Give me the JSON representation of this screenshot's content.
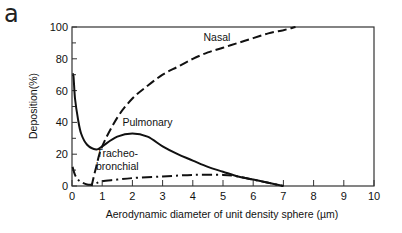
{
  "panel_label": "a",
  "chart_data": {
    "type": "line",
    "title": "",
    "xlabel": "Aerodynamic diameter of unit density sphere (µm)",
    "ylabel": "Deposition(%)",
    "xlim": [
      0,
      10
    ],
    "ylim": [
      0,
      100
    ],
    "x_ticks": [
      "0",
      "1",
      "2",
      "3",
      "4",
      "5",
      "6",
      "7",
      "8",
      "9",
      "10"
    ],
    "y_ticks": [
      "0",
      "20",
      "40",
      "60",
      "80",
      "100"
    ],
    "grid": false,
    "legend": "inline labels",
    "series": [
      {
        "name": "Nasal",
        "style": "dashed",
        "x": [
          0.65,
          0.8,
          1,
          1.5,
          2,
          2.5,
          3,
          3.5,
          4,
          4.5,
          5,
          5.5,
          6,
          6.5,
          7,
          7.4
        ],
        "y": [
          0,
          12,
          25,
          43,
          55,
          63,
          70,
          75,
          80,
          84,
          87,
          90,
          93,
          96,
          98,
          100
        ]
      },
      {
        "name": "Pulmonary",
        "style": "solid",
        "x": [
          0.02,
          0.05,
          0.1,
          0.2,
          0.3,
          0.5,
          0.8,
          1,
          1.5,
          2,
          2.5,
          3,
          3.5,
          4,
          4.5,
          5,
          5.5,
          6,
          6.5,
          7
        ],
        "y": [
          70,
          69,
          55,
          42,
          33,
          26,
          23,
          25,
          31,
          33,
          31,
          25,
          20,
          16,
          12,
          9,
          6,
          4,
          2,
          0
        ]
      },
      {
        "name": "Tracheo-bronchial",
        "style": "dash-dot",
        "x": [
          0.02,
          0.1,
          0.2,
          0.3,
          0.5,
          0.7,
          1,
          1.5,
          2,
          3,
          4,
          5,
          5.5,
          6,
          6.5,
          7
        ],
        "y": [
          12,
          7,
          4,
          2.5,
          1,
          1,
          3,
          4,
          5,
          6,
          7,
          7,
          6,
          4,
          2,
          0
        ]
      }
    ],
    "annotations": [
      {
        "text": "Nasal",
        "x": 4.8,
        "y": 91
      },
      {
        "text": "Pulmonary",
        "x": 2.5,
        "y": 38
      },
      {
        "text": "Tracheo-",
        "x": 1.5,
        "y": 18
      },
      {
        "text": "bronchial",
        "x": 1.5,
        "y": 10
      }
    ]
  }
}
